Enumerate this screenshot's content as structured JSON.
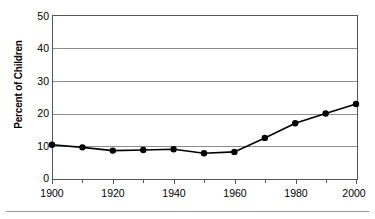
{
  "chart_data": {
    "type": "line",
    "title": "",
    "xlabel": "",
    "ylabel": "Percent of Children",
    "x": [
      1900,
      1910,
      1920,
      1930,
      1940,
      1950,
      1960,
      1970,
      1980,
      1990,
      2000
    ],
    "values": [
      10.2,
      9.4,
      8.4,
      8.6,
      8.8,
      7.6,
      8.0,
      12.3,
      16.8,
      19.8,
      22.7
    ],
    "series": [
      {
        "name": "Percent of Children",
        "values": [
          10.2,
          9.4,
          8.4,
          8.6,
          8.8,
          7.6,
          8.0,
          12.3,
          16.8,
          19.8,
          22.7
        ]
      }
    ],
    "xlim": [
      1900,
      2000
    ],
    "ylim": [
      0,
      50
    ],
    "ytick_labels": [
      "0",
      "10",
      "20",
      "30",
      "40",
      "50"
    ],
    "ytick_values": [
      0,
      10,
      20,
      30,
      40,
      50
    ],
    "xtick_labels": [
      "1900",
      "1920",
      "1940",
      "1960",
      "1980",
      "2000"
    ],
    "xtick_values": [
      1900,
      1920,
      1940,
      1960,
      1980,
      2000
    ],
    "xtick_minor_values": [
      1910,
      1930,
      1950,
      1970,
      1990
    ],
    "grid": "horizontal",
    "legend": "none",
    "marker": "filled-circle",
    "line_color": "#000000",
    "marker_color": "#000000",
    "grid_color": "#8d8d8d",
    "axis_color": "#555555",
    "background": "#ffffff"
  },
  "axes": {
    "y_title": "Percent of Children",
    "y_ticks": [
      "50",
      "40",
      "30",
      "20",
      "10",
      "0"
    ],
    "x_ticks": [
      "1900",
      "1920",
      "1940",
      "1960",
      "1980",
      "2000"
    ]
  }
}
